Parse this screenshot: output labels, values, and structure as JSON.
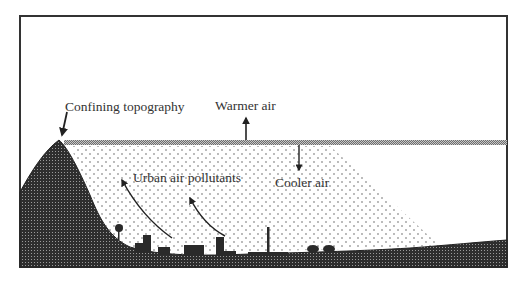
{
  "diagram": {
    "labels": {
      "topography": "Confining topography",
      "warmer": "Warmer air",
      "cooler": "Cooler air",
      "pollutants": "Urban air pollutants"
    },
    "colors": {
      "ground": "#2f2f2f",
      "inversion_layer": "#8a8a8a",
      "frame": "#333333",
      "background": "#ffffff"
    }
  }
}
